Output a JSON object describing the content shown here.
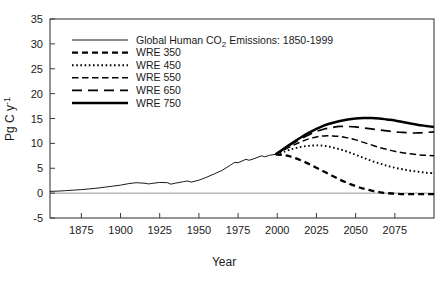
{
  "chart_data": {
    "type": "line",
    "title": "",
    "xlabel": "Year",
    "ylabel": "Pg C y-1",
    "ylabel_parts": {
      "base": "Pg C y",
      "sup": "-1"
    },
    "xlim": [
      1855,
      2100
    ],
    "ylim": [
      -5,
      35
    ],
    "grid": false,
    "legend_position": "top-left-inside",
    "xticks": [
      1875,
      1900,
      1925,
      1950,
      1975,
      2000,
      2025,
      2050,
      2075
    ],
    "xtick_labels": [
      "1875",
      "1900",
      "1925",
      "1950",
      "1975",
      "2000",
      "2025",
      "2050",
      "2075"
    ],
    "yticks": [
      -5,
      0,
      5,
      10,
      15,
      20,
      25,
      30,
      35
    ],
    "ytick_labels": [
      "-5",
      "0",
      "5",
      "10",
      "15",
      "20",
      "25",
      "30",
      "35"
    ],
    "zero_reference_line": 0,
    "series": [
      {
        "name": "Global Human CO2 Emissions: 1850-1999",
        "style": "solid-thin",
        "x": [
          1855,
          1860,
          1865,
          1870,
          1875,
          1880,
          1885,
          1890,
          1895,
          1900,
          1905,
          1910,
          1915,
          1918,
          1920,
          1925,
          1930,
          1932,
          1935,
          1940,
          1943,
          1945,
          1950,
          1955,
          1960,
          1965,
          1970,
          1973,
          1975,
          1980,
          1982,
          1985,
          1990,
          1992,
          1995,
          1999
        ],
        "y": [
          0.35,
          0.4,
          0.5,
          0.6,
          0.7,
          0.85,
          1.0,
          1.2,
          1.4,
          1.6,
          1.9,
          2.1,
          2.0,
          1.85,
          1.95,
          2.15,
          2.1,
          1.8,
          2.0,
          2.3,
          2.45,
          2.2,
          2.6,
          3.2,
          3.9,
          4.6,
          5.6,
          6.2,
          6.1,
          6.8,
          6.6,
          6.9,
          7.5,
          7.3,
          7.6,
          7.8
        ]
      },
      {
        "name": "WRE 350",
        "style": "dashed-heavy",
        "x": [
          1999,
          2005,
          2010,
          2015,
          2020,
          2025,
          2030,
          2035,
          2040,
          2045,
          2050,
          2055,
          2060,
          2065,
          2070,
          2075,
          2080,
          2085,
          2090,
          2095,
          2100
        ],
        "y": [
          7.8,
          7.6,
          7.2,
          6.6,
          5.9,
          5.1,
          4.3,
          3.5,
          2.7,
          2.0,
          1.4,
          0.9,
          0.5,
          0.2,
          0.0,
          -0.1,
          -0.2,
          -0.2,
          -0.2,
          -0.2,
          -0.2
        ]
      },
      {
        "name": "WRE 450",
        "style": "dotted",
        "x": [
          1999,
          2005,
          2010,
          2015,
          2020,
          2025,
          2030,
          2035,
          2040,
          2045,
          2050,
          2055,
          2060,
          2065,
          2070,
          2075,
          2080,
          2085,
          2090,
          2095,
          2100
        ],
        "y": [
          7.8,
          8.4,
          8.9,
          9.3,
          9.5,
          9.6,
          9.5,
          9.2,
          8.8,
          8.3,
          7.7,
          7.1,
          6.5,
          6.0,
          5.5,
          5.1,
          4.8,
          4.5,
          4.3,
          4.1,
          4.0
        ]
      },
      {
        "name": "WRE 550",
        "style": "dashed-medium",
        "x": [
          1999,
          2005,
          2010,
          2015,
          2020,
          2025,
          2030,
          2035,
          2040,
          2045,
          2050,
          2055,
          2060,
          2065,
          2070,
          2075,
          2080,
          2085,
          2090,
          2095,
          2100
        ],
        "y": [
          7.8,
          8.8,
          9.6,
          10.3,
          10.9,
          11.3,
          11.5,
          11.5,
          11.4,
          11.1,
          10.7,
          10.2,
          9.7,
          9.2,
          8.8,
          8.4,
          8.1,
          7.9,
          7.7,
          7.6,
          7.5
        ]
      },
      {
        "name": "WRE 650",
        "style": "dashed-long",
        "x": [
          1999,
          2005,
          2010,
          2015,
          2020,
          2025,
          2030,
          2035,
          2040,
          2045,
          2050,
          2055,
          2060,
          2065,
          2070,
          2075,
          2080,
          2085,
          2090,
          2095,
          2100
        ],
        "y": [
          7.8,
          9.0,
          10.0,
          10.9,
          11.7,
          12.4,
          12.9,
          13.2,
          13.4,
          13.4,
          13.3,
          13.1,
          12.9,
          12.7,
          12.5,
          12.3,
          12.2,
          12.1,
          12.1,
          12.2,
          12.3
        ]
      },
      {
        "name": "WRE 750",
        "style": "solid-heavy",
        "x": [
          1999,
          2005,
          2010,
          2015,
          2020,
          2025,
          2030,
          2035,
          2040,
          2045,
          2050,
          2055,
          2060,
          2065,
          2070,
          2075,
          2080,
          2085,
          2090,
          2095,
          2100
        ],
        "y": [
          7.8,
          9.1,
          10.2,
          11.2,
          12.1,
          12.9,
          13.6,
          14.1,
          14.5,
          14.8,
          15.0,
          15.1,
          15.1,
          15.0,
          14.8,
          14.6,
          14.3,
          14.0,
          13.7,
          13.5,
          13.3
        ]
      }
    ]
  },
  "legend": {
    "entries": [
      {
        "label": "Global Human CO2 Emissions: 1850-1999",
        "label_pre": "Global Human CO",
        "label_sub": "2",
        "label_post": " Emissions: 1850-1999",
        "style": "solid-thin"
      },
      {
        "label": "WRE 350",
        "style": "dashed-heavy"
      },
      {
        "label": "WRE 450",
        "style": "dotted"
      },
      {
        "label": "WRE 550",
        "style": "dashed-medium"
      },
      {
        "label": "WRE 650",
        "style": "dashed-long"
      },
      {
        "label": "WRE 750",
        "style": "solid-heavy"
      }
    ]
  },
  "colors": {
    "line": "#000000",
    "frame": "#3c3c3c",
    "zero_line": "#9a9a9a",
    "text": "#1a1a1a",
    "background": "#ffffff"
  }
}
